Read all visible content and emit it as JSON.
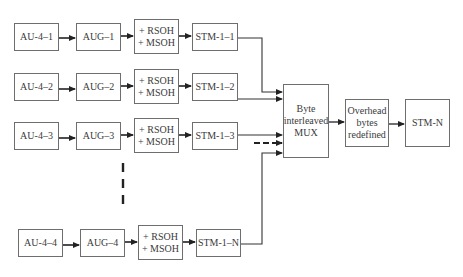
{
  "diagram": {
    "rows": [
      {
        "au": "AU-4–1",
        "aug": "AUG–1",
        "oh": [
          "+ RSOH",
          "+ MSOH"
        ],
        "stm": "STM-1–1"
      },
      {
        "au": "AU-4–2",
        "aug": "AUG–2",
        "oh": [
          "+ RSOH",
          "+ MSOH"
        ],
        "stm": "STM-1–2"
      },
      {
        "au": "AU-4–3",
        "aug": "AUG–3",
        "oh": [
          "+ RSOH",
          "+ MSOH"
        ],
        "stm": "STM-1–3"
      },
      {
        "au": "AU-4–4",
        "aug": "AUG–4",
        "oh": [
          "+ RSOH",
          "+ MSOH"
        ],
        "stm": "STM-1–N"
      }
    ],
    "mux": [
      "Byte",
      "interleaved",
      "MUX"
    ],
    "overhead": [
      "Overhead",
      "bytes",
      "redefined"
    ],
    "output": "STM-N",
    "line_color": "#222222",
    "box_border_color": "#6e6e6e"
  }
}
